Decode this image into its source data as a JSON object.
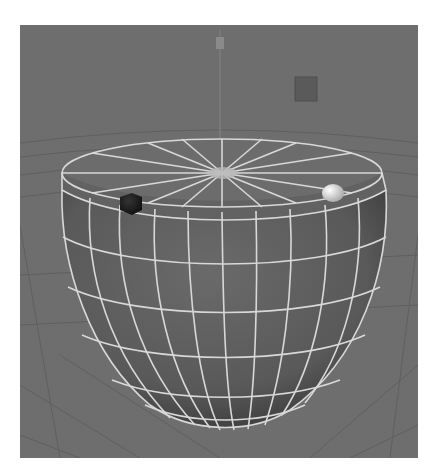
{
  "viewport": {
    "label": "3D perspective viewport",
    "background_color": "#6e6e6e",
    "ground_grid_color": "#5e5e5e",
    "wireframe_color": "#d8d8d8"
  },
  "scene": {
    "object": {
      "name": "sphere-bowl",
      "description": "Sphere with top cut off, shown with wireframe edges",
      "body_color": "#5a5a5a",
      "cap_color": "#6a6a6a"
    },
    "pivot": {
      "name": "pivot-handle",
      "color": "#8a8a8a"
    },
    "light_icon": {
      "name": "square-light-icon",
      "color": "#5a5a5a"
    },
    "dark_marker": {
      "name": "dark-sphere-marker",
      "color": "#1e1e1e"
    },
    "light_marker": {
      "name": "light-sphere-marker",
      "color": "#d0d0d0"
    }
  }
}
